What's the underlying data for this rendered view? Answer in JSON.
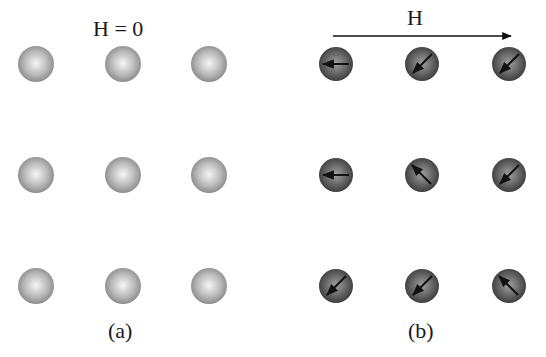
{
  "panels": [
    {
      "id": "a",
      "title": "H = 0",
      "caption": "(a)",
      "field_arrow": false,
      "sphere_style": "light",
      "spins": [
        [
          null,
          null,
          null
        ],
        [
          null,
          null,
          null
        ],
        [
          null,
          null,
          null
        ]
      ]
    },
    {
      "id": "b",
      "title": "H",
      "caption": "(b)",
      "field_arrow": true,
      "sphere_style": "dark",
      "spins": [
        [
          "left",
          "down-left",
          "down-left"
        ],
        [
          "left",
          "up-left",
          "down-left"
        ],
        [
          "down-left",
          "down-left",
          "up-left"
        ]
      ]
    }
  ],
  "colors": {
    "light_sphere_center": "#f4f4f4",
    "light_sphere_edge": "#8a8a8a",
    "dark_sphere_center": "#9a9a9a",
    "dark_sphere_edge": "#3a3a3a",
    "arrow": "#111111"
  }
}
